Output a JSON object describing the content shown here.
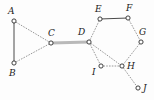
{
  "figure": {
    "kind": "undirected-graph-diagram",
    "width": 154,
    "height": 100,
    "background_color": "#fdfdfd",
    "node_fill_color": "#ffffff",
    "node_stroke_color": "#2b2b2b",
    "node_radius": 2.1,
    "edge_color_dotted": "#8c8c8c",
    "edge_color_solid": "#4a4a4a",
    "edge_color_highlight": "#b9b9b9",
    "label_color": "#1a1a1a"
  },
  "nodes": [
    {
      "id": "A",
      "label": "A",
      "x": 14,
      "y": 21,
      "label_x": 8,
      "label_y": 7
    },
    {
      "id": "B",
      "label": "B",
      "x": 14,
      "y": 63,
      "label_x": 9,
      "label_y": 69
    },
    {
      "id": "C",
      "label": "C",
      "x": 51,
      "y": 43,
      "label_x": 48,
      "label_y": 29
    },
    {
      "id": "D",
      "label": "D",
      "x": 89,
      "y": 42,
      "label_x": 78,
      "label_y": 28
    },
    {
      "id": "E",
      "label": "E",
      "x": 100,
      "y": 19,
      "label_x": 95,
      "label_y": 5
    },
    {
      "id": "F",
      "label": "F",
      "x": 128,
      "y": 18,
      "label_x": 126,
      "label_y": 4
    },
    {
      "id": "G",
      "label": "G",
      "x": 141,
      "y": 42,
      "label_x": 139,
      "label_y": 28
    },
    {
      "id": "H",
      "label": "H",
      "x": 122,
      "y": 66,
      "label_x": 127,
      "label_y": 62
    },
    {
      "id": "I",
      "label": "I",
      "x": 101,
      "y": 66,
      "label_x": 92,
      "label_y": 68
    },
    {
      "id": "J",
      "label": "J",
      "x": 138,
      "y": 88,
      "label_x": 143,
      "label_y": 84
    }
  ],
  "edges": [
    {
      "from": "A",
      "to": "B",
      "style": "solid",
      "width": 1.0
    },
    {
      "from": "A",
      "to": "C",
      "style": "dotted",
      "width": 0.9
    },
    {
      "from": "B",
      "to": "C",
      "style": "dotted",
      "width": 0.9
    },
    {
      "from": "C",
      "to": "D",
      "style": "highlight",
      "width": 3.0
    },
    {
      "from": "D",
      "to": "E",
      "style": "dotted",
      "width": 0.9
    },
    {
      "from": "E",
      "to": "F",
      "style": "solid",
      "width": 1.0
    },
    {
      "from": "F",
      "to": "G",
      "style": "dotted",
      "width": 0.9
    },
    {
      "from": "G",
      "to": "H",
      "style": "dotted",
      "width": 0.9
    },
    {
      "from": "D",
      "to": "I",
      "style": "dotted",
      "width": 0.9
    },
    {
      "from": "I",
      "to": "H",
      "style": "dotted",
      "width": 0.9
    },
    {
      "from": "D",
      "to": "H",
      "style": "dotted",
      "width": 0.9
    },
    {
      "from": "H",
      "to": "J",
      "style": "dotted",
      "width": 0.9
    }
  ]
}
